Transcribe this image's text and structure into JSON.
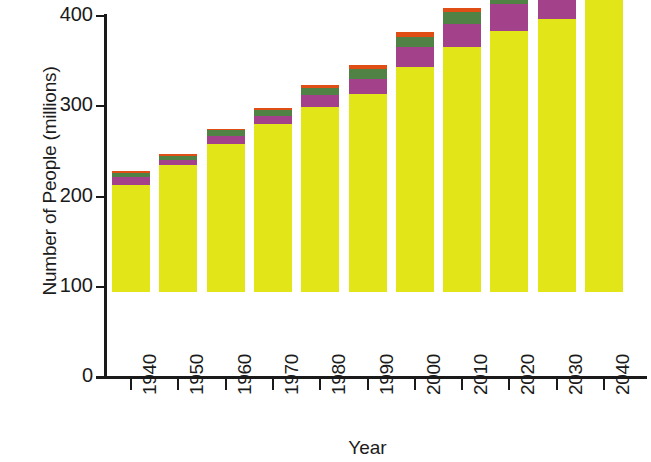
{
  "chart_data": {
    "type": "bar",
    "title": "",
    "subtitle": "",
    "xlabel": "Year",
    "ylabel": "Number of People (millions)",
    "categories": [
      "1940",
      "1950",
      "1960",
      "1970",
      "1980",
      "1990",
      "2000",
      "2010",
      "2020",
      "2030",
      "2040"
    ],
    "stacked": true,
    "grid": false,
    "legend_position": "none",
    "ylim": [
      0,
      400
    ],
    "yticks": [
      0,
      100,
      200,
      300,
      400
    ],
    "ytick_labels": [
      "0",
      "100",
      "200",
      "300",
      "400"
    ],
    "series": [
      {
        "name": "segment-1-yellow",
        "color": "#e2e618",
        "values": [
          119,
          141,
          164,
          186,
          205,
          219,
          249,
          271,
          289,
          303,
          330
        ]
      },
      {
        "name": "segment-2-purple",
        "color": "#a3428a",
        "values": [
          8,
          5,
          9,
          9,
          13,
          17,
          23,
          26,
          30,
          32,
          33
        ]
      },
      {
        "name": "segment-3-green",
        "color": "#4f8244",
        "values": [
          5,
          5,
          6,
          7,
          8,
          11,
          11,
          13,
          19,
          26,
          32
        ]
      },
      {
        "name": "segment-4-orange",
        "color": "#e04e16",
        "values": [
          2,
          2,
          2,
          2,
          3,
          4,
          5,
          5,
          8,
          12,
          16
        ]
      }
    ],
    "totals": [
      134,
      153,
      181,
      204,
      229,
      251,
      288,
      315,
      346,
      373,
      411
    ]
  },
  "axes": {
    "y_title": "Number of People (millions)",
    "x_title": "Year"
  }
}
